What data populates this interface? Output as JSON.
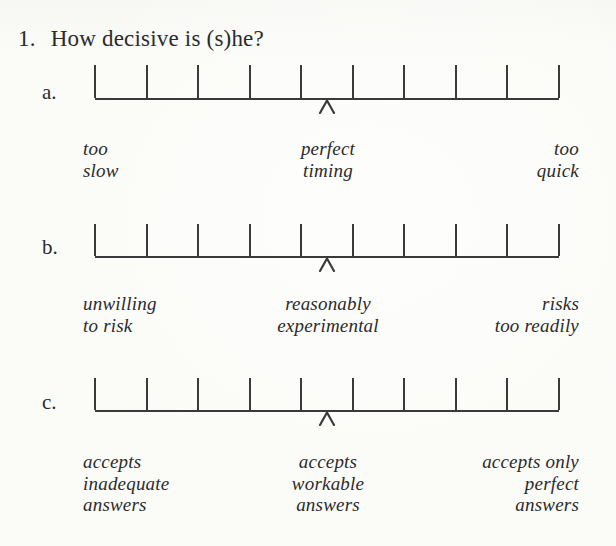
{
  "colors": {
    "ink": "#2b2b2b",
    "line": "#3a3a3a",
    "paper": "#fbfbf8"
  },
  "question": {
    "number": "1.",
    "text": "How decisive is (s)he?"
  },
  "scales": [
    {
      "letter": "a.",
      "ticks": 10,
      "marker_position": 0.5,
      "labels": {
        "left": "too\nslow",
        "center": "perfect\ntiming",
        "right": "too\nquick"
      }
    },
    {
      "letter": "b.",
      "ticks": 10,
      "marker_position": 0.5,
      "labels": {
        "left": "unwilling\nto risk",
        "center": "reasonably\nexperimental",
        "right": "risks\ntoo readily"
      }
    },
    {
      "letter": "c.",
      "ticks": 10,
      "marker_position": 0.5,
      "labels": {
        "left": "accepts\ninadequate\nanswers",
        "center": "accepts\nworkable\nanswers",
        "right": "accepts only\nperfect\nanswers"
      }
    }
  ]
}
